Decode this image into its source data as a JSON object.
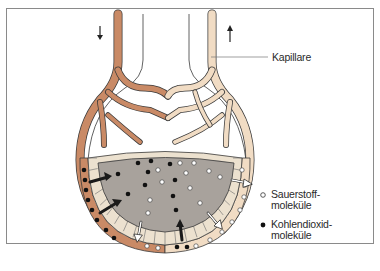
{
  "diagram": {
    "type": "alveolus gas exchange illustration",
    "labels": {
      "capillary": "Kapillare",
      "oxygen_line1": "Sauerstoff-",
      "oxygen_line2": "moleküle",
      "co2_line1": "Kohlendioxid-",
      "co2_line2": "moleküle"
    },
    "legend": [
      {
        "symbol": "open-circle",
        "meaning": "Sauerstoffmoleküle"
      },
      {
        "symbol": "filled-circle",
        "meaning": "Kohlendioxidmoleküle"
      }
    ],
    "flow_arrows": [
      {
        "side": "left",
        "direction": "down"
      },
      {
        "side": "right",
        "direction": "up"
      }
    ],
    "colors": {
      "deoxygenated_vessel": "#c98a66",
      "oxygenated_vessel": "#f1dcc4",
      "alveolus_air": "#a8a29c",
      "epithelium": "#ece1cf",
      "frame": "#8a8a8a",
      "outline": "#3a3a3a"
    }
  }
}
